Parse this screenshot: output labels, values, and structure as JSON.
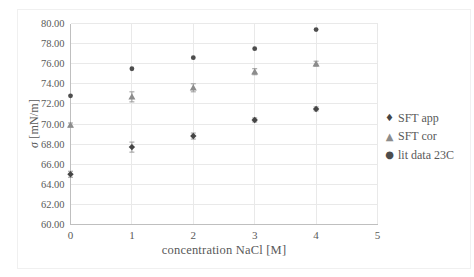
{
  "chart_data": {
    "type": "scatter",
    "title": "",
    "xlabel": "concentration NaCl [M]",
    "ylabel_symbol": "σ",
    "ylabel_unit": " [mN/m]",
    "xlim": [
      0,
      5
    ],
    "ylim": [
      60,
      80
    ],
    "grid": true,
    "legend_position": "right",
    "x_ticks": [
      "0",
      "1",
      "2",
      "3",
      "4",
      "5"
    ],
    "y_ticks": [
      "80.00",
      "78.00",
      "76.00",
      "74.00",
      "72.00",
      "70.00",
      "68.00",
      "66.00",
      "64.00",
      "62.00",
      "60.00"
    ],
    "x": [
      0,
      1,
      2,
      3,
      4
    ],
    "series": [
      {
        "name": "SFT app",
        "marker": "diamond",
        "color": "#454545",
        "values": [
          65.0,
          67.7,
          68.8,
          70.4,
          71.5
        ],
        "errors": [
          0.3,
          0.5,
          0.3,
          0.2,
          0.2
        ]
      },
      {
        "name": "SFT cor",
        "marker": "triangle",
        "color": "#8c8c8c",
        "values": [
          69.9,
          72.7,
          73.6,
          75.2,
          76.0
        ],
        "errors": [
          0.2,
          0.5,
          0.4,
          0.3,
          0.25
        ]
      },
      {
        "name": "lit data 23C",
        "marker": "circle",
        "color": "#4d4d4d",
        "values": [
          72.8,
          75.5,
          76.6,
          77.5,
          79.4
        ],
        "errors": [
          0,
          0,
          0,
          0,
          0
        ]
      }
    ]
  },
  "colors": {
    "grid": "#e9e9e9",
    "axis": "#bfbfbf",
    "text": "#595959",
    "error_bar": "#9b9b9b",
    "background": "#ffffff"
  }
}
